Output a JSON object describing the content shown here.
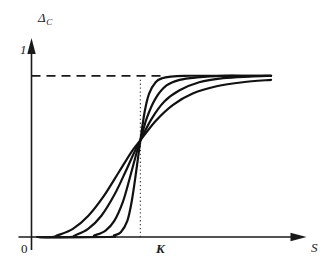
{
  "figure": {
    "background_color": "#ffffff",
    "ink_color": "#111111"
  },
  "labels": {
    "y_axis_symbol": "Δ",
    "y_axis_subscript": "C",
    "y_tick_one": "1",
    "origin": "0",
    "x_tick_k": "K",
    "x_axis_symbol": "S"
  },
  "chart_data": {
    "type": "line",
    "title": "",
    "xlabel": "S",
    "ylabel": "Δ_C",
    "grid": false,
    "legend": null,
    "xlim": [
      0,
      1.18
    ],
    "ylim": [
      0,
      1.16
    ],
    "x_ticks": [
      {
        "value": 0,
        "label": "0"
      },
      {
        "value": 0.5,
        "label": "K"
      }
    ],
    "y_ticks": [
      {
        "value": 0,
        "label": "0"
      },
      {
        "value": 1,
        "label": "1"
      }
    ],
    "annotations": [
      {
        "name": "asymptote-line",
        "style": "dashed",
        "from": [
          0,
          1
        ],
        "to": [
          0.605,
          1
        ]
      },
      {
        "name": "k-reference-line",
        "style": "dotted",
        "from": [
          0.5,
          0
        ],
        "to": [
          0.5,
          1
        ]
      }
    ],
    "common_crossing_point": {
      "x": 0.5,
      "y": 0.6
    },
    "series": [
      {
        "name": "curve-1-steepest",
        "steepness": 22,
        "midpoint": 0.5,
        "x": [
          0.38,
          0.41,
          0.44,
          0.46,
          0.48,
          0.5,
          0.52,
          0.54,
          0.57,
          0.6,
          0.64,
          0.7,
          0.8,
          0.95,
          1.1
        ],
        "y": [
          0.01,
          0.03,
          0.1,
          0.22,
          0.4,
          0.6,
          0.78,
          0.89,
          0.96,
          0.985,
          0.995,
          1.0,
          1.0,
          1.0,
          1.0
        ]
      },
      {
        "name": "curve-2-steep",
        "steepness": 13,
        "midpoint": 0.5,
        "x": [
          0.29,
          0.34,
          0.38,
          0.42,
          0.45,
          0.48,
          0.5,
          0.53,
          0.57,
          0.62,
          0.68,
          0.76,
          0.88,
          1.0,
          1.1
        ],
        "y": [
          0.01,
          0.04,
          0.1,
          0.22,
          0.36,
          0.51,
          0.6,
          0.74,
          0.86,
          0.94,
          0.975,
          0.99,
          1.0,
          1.0,
          1.0
        ]
      },
      {
        "name": "curve-3-moderate",
        "steepness": 8,
        "midpoint": 0.5,
        "x": [
          0.2,
          0.26,
          0.32,
          0.38,
          0.43,
          0.47,
          0.5,
          0.55,
          0.61,
          0.68,
          0.77,
          0.88,
          1.0,
          1.1
        ],
        "y": [
          0.01,
          0.05,
          0.13,
          0.26,
          0.4,
          0.52,
          0.6,
          0.73,
          0.84,
          0.91,
          0.96,
          0.985,
          0.995,
          1.0
        ]
      },
      {
        "name": "curve-4-shallow",
        "steepness": 5.5,
        "midpoint": 0.5,
        "x": [
          0.12,
          0.19,
          0.26,
          0.33,
          0.4,
          0.46,
          0.5,
          0.57,
          0.65,
          0.74,
          0.85,
          0.97,
          1.1
        ],
        "y": [
          0.01,
          0.05,
          0.13,
          0.25,
          0.4,
          0.53,
          0.6,
          0.72,
          0.82,
          0.89,
          0.935,
          0.96,
          0.975
        ]
      }
    ]
  }
}
